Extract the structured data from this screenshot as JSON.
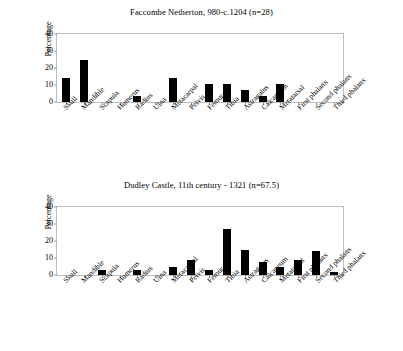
{
  "chart_data": [
    {
      "type": "bar",
      "title": "Faccombe Netherton, 980-c.1204 (n=28)",
      "xlabel": "",
      "ylabel": "Percentage",
      "ylim": [
        0,
        40
      ],
      "yticks": [
        0,
        10,
        20,
        30,
        40
      ],
      "grid": false,
      "legend": "none",
      "categories": [
        "Skull",
        "Mandible",
        "Scapula",
        "Humerus",
        "Radius",
        "Ulna",
        "Metacarpal",
        "Pelvis",
        "Femur",
        "Tibia",
        "Astragalus",
        "Calcaneum",
        "Metatarsal",
        "First phalanx",
        "Second phalanx",
        "Third phalanx"
      ],
      "values": [
        14.3,
        25.0,
        0,
        0,
        3.6,
        0,
        14.3,
        0,
        10.7,
        10.7,
        7.1,
        3.6,
        10.7,
        0,
        0,
        0
      ],
      "bar_color": "#000000"
    },
    {
      "type": "bar",
      "title": "Dudley Castle, 11th century - 1321 (n=67.5)",
      "xlabel": "",
      "ylabel": "Percentage",
      "ylim": [
        0,
        40
      ],
      "yticks": [
        0,
        10,
        20,
        30,
        40
      ],
      "grid": false,
      "legend": "none",
      "categories": [
        "Skull",
        "Mandible",
        "Scapula",
        "Humerus",
        "Radius",
        "Ulna",
        "Metacarpal",
        "Pelvis",
        "Femur",
        "Tibia",
        "Astragalus",
        "Calcaneum",
        "Metatarsal",
        "First phalanx",
        "Second phalanx",
        "Third phalanx"
      ],
      "values": [
        0,
        0,
        2.7,
        0,
        2.7,
        0,
        4.8,
        9.0,
        3.0,
        27.0,
        15.0,
        7.8,
        5.0,
        9.0,
        14.0,
        2.0
      ],
      "bar_color": "#000000"
    }
  ],
  "style": {
    "frame_color": "#bfbfbf",
    "tick_color": "#9a9a9a",
    "background": "#ffffff"
  }
}
